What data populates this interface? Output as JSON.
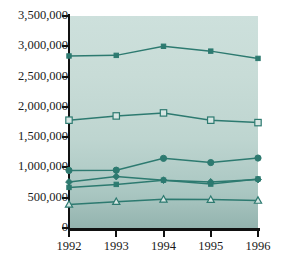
{
  "chart_data": {
    "type": "line",
    "title": "",
    "xlabel": "",
    "ylabel": "",
    "x": [
      1992,
      1993,
      1994,
      1995,
      1996
    ],
    "categories": [
      "1992",
      "1993",
      "1994",
      "1995",
      "1996"
    ],
    "ylim": [
      0,
      3500000
    ],
    "xlim": [
      1992,
      1996
    ],
    "grid": false,
    "legend": "none",
    "y_ticks": [
      0,
      500000,
      1000000,
      1500000,
      2000000,
      2500000,
      3000000,
      3500000
    ],
    "y_tick_labels": [
      "0",
      "500,000",
      "1,000,000",
      "1,500,000",
      "2,000,000",
      "2,500,000",
      "3,000,000",
      "3,500,000"
    ],
    "x_tick_labels": [
      "1992",
      "1993",
      "1994",
      "1995",
      "1996"
    ],
    "series": [
      {
        "name": "series-1",
        "marker": "small-filled-square",
        "color": "#2d7a70",
        "values": [
          2840000,
          2850000,
          3000000,
          2920000,
          2800000
        ]
      },
      {
        "name": "series-2",
        "marker": "open-square",
        "color": "#2d7a70",
        "values": [
          1780000,
          1850000,
          1900000,
          1780000,
          1740000
        ]
      },
      {
        "name": "series-3",
        "marker": "filled-circle",
        "color": "#2d7a70",
        "values": [
          950000,
          955000,
          1150000,
          1080000,
          1155000
        ]
      },
      {
        "name": "series-4",
        "marker": "filled-diamond",
        "color": "#2d7a70",
        "values": [
          760000,
          850000,
          790000,
          760000,
          800000
        ]
      },
      {
        "name": "series-5",
        "marker": "small-filled-square",
        "color": "#2d7a70",
        "values": [
          670000,
          720000,
          790000,
          725000,
          810000
        ]
      },
      {
        "name": "series-6",
        "marker": "open-triangle",
        "color": "#2d7a70",
        "values": [
          390000,
          435000,
          475000,
          470000,
          455000
        ]
      }
    ],
    "colors": {
      "line": "#2d7a70",
      "plot_background_top": "#cde0dc",
      "plot_background_bottom": "#93b3ae",
      "axis": "#111111",
      "page_background": "#ffffff",
      "text": "#1a1a1a"
    }
  }
}
